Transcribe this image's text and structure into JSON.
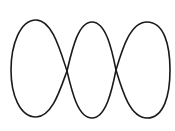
{
  "figure": {
    "stroke_color": "#1a1a1a",
    "background": "#ffffff",
    "loops": [
      {
        "name": "left-loop",
        "cx": 39,
        "cy": 69,
        "rx": 28,
        "ry": 49
      },
      {
        "name": "middle-loop",
        "cx": 92,
        "cy": 70,
        "rx": 25,
        "ry": 48
      },
      {
        "name": "right-loop",
        "cx": 144,
        "cy": 70,
        "rx": 27,
        "ry": 48
      }
    ],
    "crossings": [
      {
        "x": 67,
        "y": 71
      },
      {
        "x": 116,
        "y": 70
      }
    ]
  }
}
